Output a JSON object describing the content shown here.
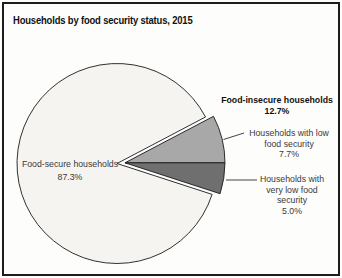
{
  "header": {
    "title": "Households by food security status, 2015"
  },
  "chart_data": {
    "type": "pie",
    "title": "Households by food security status, 2015",
    "legend_position": "none",
    "exploded_group": "Food-insecure households",
    "slices": [
      {
        "label": "Food-secure households",
        "value": 87.3,
        "color": "#f5f4f1"
      },
      {
        "label": "Households with low food security",
        "value": 7.7,
        "color": "#a8a8a8"
      },
      {
        "label": "Households with very low food security",
        "value": 5.0,
        "color": "#6f6f6f"
      }
    ],
    "group": {
      "label": "Food-insecure households",
      "value": 12.7
    }
  },
  "labels": {
    "food_secure": "Food-secure households\n87.3%",
    "food_insecure_group": "Food-insecure households\n12.7%",
    "low": "Households with low\nfood security\n7.7%",
    "very_low": "Households with\nvery low food\nsecurity\n5.0%"
  },
  "colors": {
    "food_secure": "#f5f4f1",
    "low": "#a8a8a8",
    "very_low": "#6f6f6f",
    "outline": "#1a1a1a",
    "frame": "#1d1d1d"
  }
}
